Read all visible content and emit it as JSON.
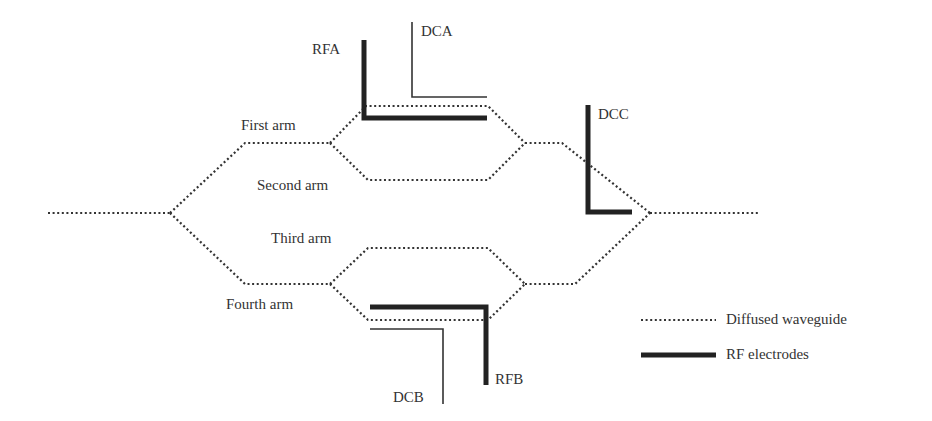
{
  "diagram": {
    "type": "dual-parallel Mach-Zehnder modulator schematic",
    "arms": [
      {
        "id": "first",
        "label": "First arm"
      },
      {
        "id": "second",
        "label": "Second arm"
      },
      {
        "id": "third",
        "label": "Third arm"
      },
      {
        "id": "fourth",
        "label": "Fourth arm"
      }
    ],
    "electrodes": {
      "rfa": "RFA",
      "dca": "DCA",
      "dcc": "DCC",
      "rfb": "RFB",
      "dcb": "DCB"
    },
    "legend": [
      {
        "style": "dotted",
        "label": "Diffused waveguide"
      },
      {
        "style": "thick",
        "label": "RF electrodes"
      }
    ],
    "colors": {
      "line": "#333333",
      "electrode": "#222222",
      "background": "#ffffff"
    }
  }
}
